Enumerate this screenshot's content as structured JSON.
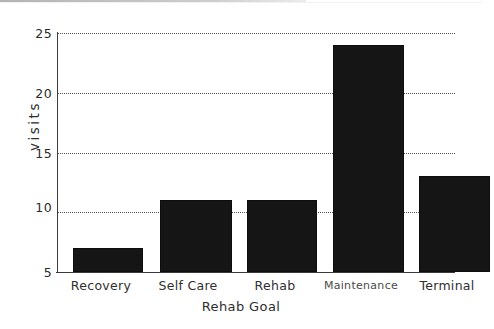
{
  "chart_data": {
    "type": "bar",
    "title": "",
    "subtitle": "",
    "xlabel": "Rehab Goal",
    "ylabel": "visits",
    "categories": [
      "Recovery",
      "Self Care",
      "Rehab",
      "Maintenance",
      "Terminal"
    ],
    "values": [
      7,
      11,
      11,
      24,
      13
    ],
    "series": [
      {
        "name": "visits",
        "values": [
          7,
          11,
          11,
          24,
          13
        ]
      }
    ],
    "ylim": [
      5,
      25
    ],
    "yticks": [
      5,
      10,
      15,
      20,
      25
    ],
    "ytick_labels": [
      "5",
      "10",
      "15",
      "20",
      "25"
    ],
    "grid": "horizontal-dotted",
    "legend": "none",
    "bar_color": "#151515",
    "axis_color": "#3a3a3a",
    "grid_color": "#555555",
    "background": "#ffffff"
  },
  "axes": {
    "y_title": "visits",
    "x_title": "Rehab Goal",
    "y_tick_0": "5",
    "y_tick_1": "10",
    "y_tick_2": "15",
    "y_tick_3": "20",
    "y_tick_4": "25",
    "x_tick_0": "Recovery",
    "x_tick_1": "Self Care",
    "x_tick_2": "Rehab",
    "x_tick_3": "Maintenance",
    "x_tick_4": "Terminal"
  }
}
